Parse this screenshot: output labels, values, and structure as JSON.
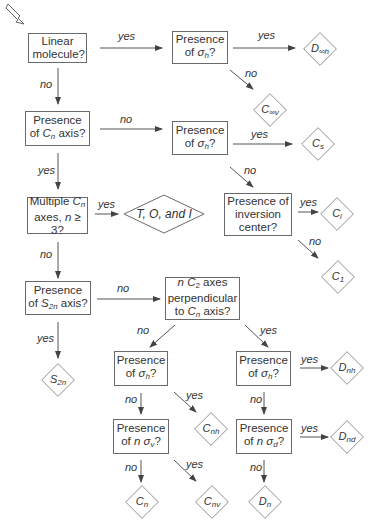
{
  "start_marker": "hollow-arrow",
  "questions": {
    "linear": "Linear molecule?",
    "sigma_h_linear": [
      "Presence",
      "of σh?"
    ],
    "cn_axis": [
      "Presence",
      "of Cn axis?"
    ],
    "sigma_h_nocn": [
      "Presence",
      "of σh?"
    ],
    "multiple_cn": [
      "Multiple Cn",
      "axes, n ≥ 3?"
    ],
    "inversion": [
      "Presence of",
      "inversion",
      "center?"
    ],
    "s2n_axis": [
      "Presence",
      "of S2n axis?"
    ],
    "nc2_perp": [
      "n C2 axes",
      "perpendicular",
      "to Cn axis?"
    ],
    "sigma_h_left": [
      "Presence",
      "of σh?"
    ],
    "n_sigma_v": [
      "Presence",
      "of n σv?"
    ],
    "sigma_h_right": [
      "Presence",
      "of σh?"
    ],
    "n_sigma_d": [
      "Presence",
      "of n σd?"
    ]
  },
  "results": {
    "d_inf_h": "D∞h",
    "c_inf_v": "C∞v",
    "cs": "Cs",
    "toi": "T, O, and I",
    "ci": "Ci",
    "c1": "C1",
    "s2n": "S2n",
    "cnh": "Cnh",
    "cn": "Cn",
    "cnv": "Cnv",
    "dnh": "Dnh",
    "dnd": "Dnd",
    "dn": "Dn"
  },
  "edge_labels": {
    "yes": "yes",
    "no": "no"
  },
  "colors": {
    "line": "#6a6a6a",
    "text": "#333333"
  }
}
